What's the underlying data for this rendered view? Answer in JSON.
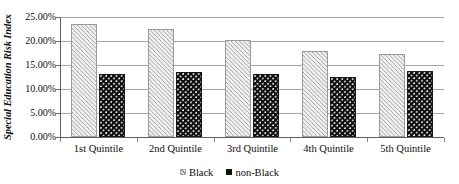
{
  "chart_data": {
    "type": "bar",
    "title": "",
    "subtitle": "",
    "xlabel": "",
    "ylabel": "Special Education Risk Index",
    "categories": [
      "1st Quintile",
      "2nd Quintile",
      "3rd Quintile",
      "4th Quintile",
      "5th Quintile"
    ],
    "series": [
      {
        "name": "Black",
        "values": [
          23.5,
          22.6,
          20.2,
          18.0,
          17.2
        ]
      },
      {
        "name": "non-Black",
        "values": [
          13.1,
          13.5,
          13.1,
          12.6,
          13.7
        ]
      }
    ],
    "ylim": [
      0,
      25
    ],
    "ytick_values": [
      0,
      5,
      10,
      15,
      20,
      25
    ],
    "ytick_labels": [
      "0.00%",
      "5.00%",
      "10.00%",
      "15.00%",
      "20.00%",
      "25.00%"
    ],
    "value_unit": "%",
    "grid": "horizontal",
    "legend_position": "bottom-center",
    "series_colors": [
      "#c8c8c8",
      "#111111"
    ],
    "gridline_color": "#a6a6a6",
    "axis_color": "#5f5f5f"
  },
  "legend": {
    "items": [
      {
        "label": "Black",
        "swatch": "hatched-square-icon"
      },
      {
        "label": "non-Black",
        "swatch": "solid-square-icon"
      }
    ]
  }
}
